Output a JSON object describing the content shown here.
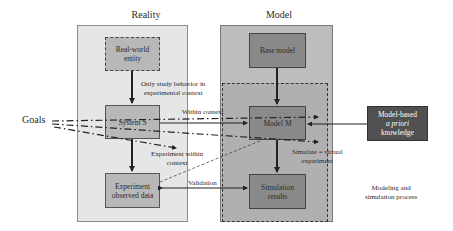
{
  "diagram": {
    "sections": {
      "reality": {
        "title": "Reality"
      },
      "model": {
        "title": "Model"
      }
    },
    "nodes": {
      "real_world_entity": {
        "line1": "Real-world",
        "line2": "entity"
      },
      "system_s": {
        "label": "System S"
      },
      "experiment_data": {
        "line1": "Experiment",
        "line2": "observed data"
      },
      "base_model": {
        "label": "Base model"
      },
      "model_m": {
        "label": "Model M"
      },
      "simulation_results": {
        "line1": "Simulation",
        "line2": "results"
      },
      "apriori": {
        "line1": "Model-based",
        "line2": "a priori",
        "line3": "knowledge"
      }
    },
    "edge_labels": {
      "study_behavior": {
        "line1": "Only study behavior in",
        "line2": "experimental context"
      },
      "within_context": "Within context",
      "experiment_within": {
        "line1": "Experiment within",
        "line2": "context"
      },
      "simulate": {
        "line1": "Simulate = virtual",
        "line2": "experiment"
      },
      "validation": "Validation"
    },
    "goals": "Goals",
    "caption": {
      "line1": "Modeling and",
      "line2": "simulation process"
    },
    "colors": {
      "reality_panel": "#e6e6e6",
      "model_panel": "#bdbdbd",
      "inner_dashed": "#b0b0b0",
      "reality_node": "#b8b8b8",
      "model_node": "#8a8a8a",
      "apriori_node": "#505050",
      "apriori_text": "#ffffff",
      "stroke": "#222222"
    }
  }
}
